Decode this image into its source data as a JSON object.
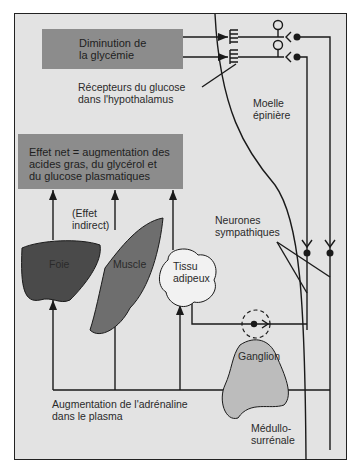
{
  "diagram": {
    "colors": {
      "background": "#e3e3e3",
      "box_fill": "#8c8c8c",
      "line": "#1a1a1a",
      "organ_dark": "#4a4a4a",
      "organ_mid": "#6e6e6e"
    },
    "boxes": {
      "stimulus": "Diminution de\nla glycémie",
      "net_effect": "Effet net = augmentation des\nacides gras, du glycérol et\ndu glucose plasmatiques"
    },
    "labels": {
      "receptors": "Récepteurs du glucose\ndans l'hypothalamus",
      "spinal_cord": "Moelle\népinière",
      "indirect_effect": "(Effet\nindirect)",
      "sympathetic_neurons": "Neurones\nsympathiques",
      "ganglion": "Ganglion",
      "adrenaline": "Augmentation de l'adrénaline\ndans le plasma",
      "adrenal_medulla": "Médullo-\nsurrénale"
    },
    "organs": {
      "liver": "Foie",
      "muscle": "Muscle",
      "adipose": "Tissu\nadipeux"
    }
  }
}
